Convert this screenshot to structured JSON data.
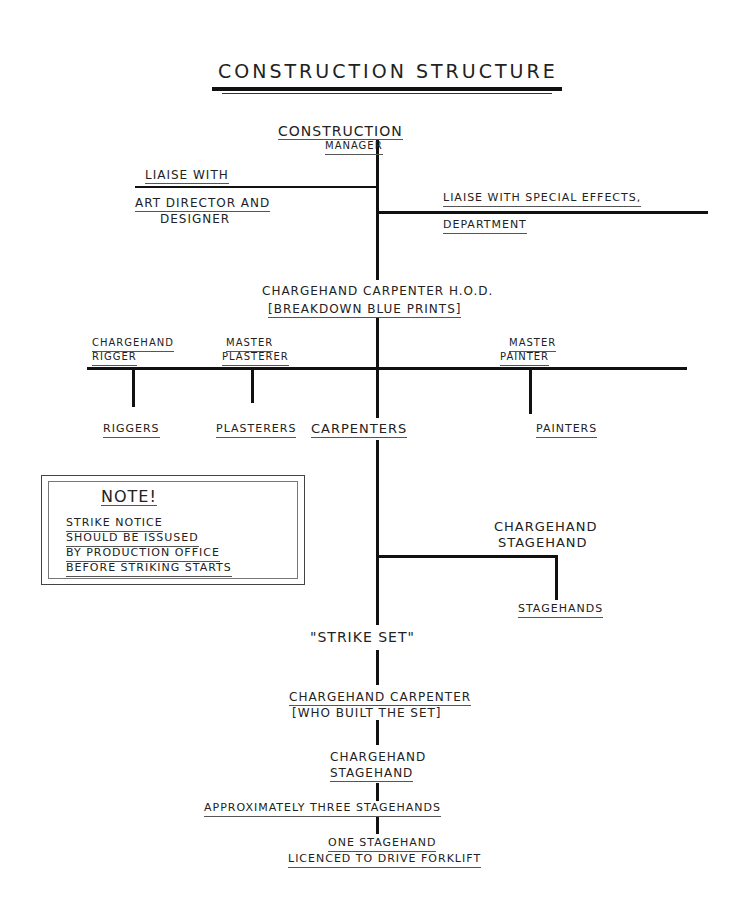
{
  "title": "Construction Structure",
  "nodes": {
    "construction_manager": [
      "Construction",
      "Manager"
    ],
    "liaise_art": [
      "Liaise with",
      "Art Director and",
      "Designer"
    ],
    "liaise_sfx": [
      "Liaise with Special Effects,",
      "Department"
    ],
    "chargehand_carpenter_hod": [
      "Chargehand Carpenter H.O.D.",
      "[Breakdown Blue Prints]"
    ],
    "chargehand_rigger": [
      "Chargehand",
      "Rigger"
    ],
    "master_plasterer": [
      "Master",
      "Plasterer"
    ],
    "master_painter": [
      "Master",
      "Painter"
    ],
    "riggers": "Riggers",
    "plasterers": "Plasterers",
    "carpenters": "Carpenters",
    "painters": "Painters",
    "chargehand_stagehand_1": [
      "Chargehand",
      "Stagehand"
    ],
    "stagehands": "Stagehands",
    "strike_set": "\"Strike Set\"",
    "chargehand_carpenter_built": [
      "Chargehand Carpenter",
      "[Who built the set]"
    ],
    "chargehand_stagehand_2": [
      "Chargehand",
      "Stagehand"
    ],
    "three_stagehands": "Approximately three stagehands",
    "forklift": [
      "One stagehand",
      "Licenced to drive forklift"
    ]
  },
  "note": {
    "heading": "Note!",
    "lines": [
      "Strike notice",
      "should be issused",
      "by production office",
      "before striking starts"
    ]
  }
}
